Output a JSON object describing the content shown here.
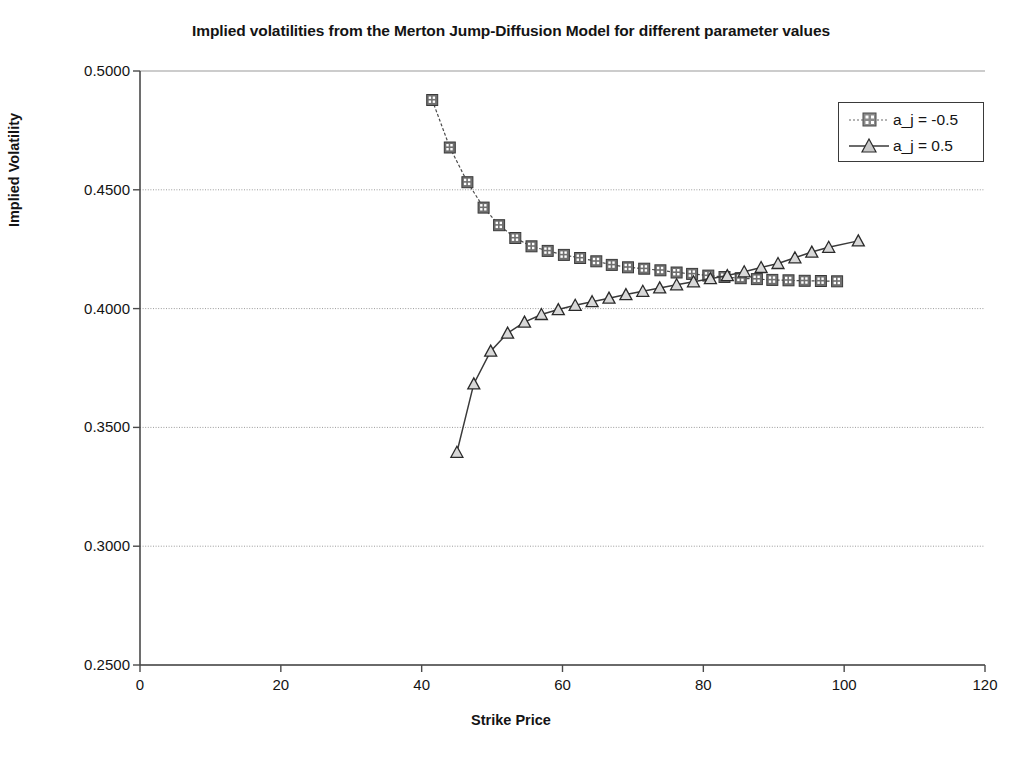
{
  "chart_data": {
    "type": "line",
    "title": "Implied volatilities from the Merton Jump-Diffusion Model for different parameter values",
    "xlabel": "Strike Price",
    "ylabel": "Implied Volatility",
    "xlim": [
      0,
      120
    ],
    "ylim": [
      0.25,
      0.5
    ],
    "xticks": [
      0,
      20,
      40,
      60,
      80,
      100,
      120
    ],
    "xtick_labels": [
      "0",
      "20",
      "40",
      "60",
      "80",
      "100",
      "120"
    ],
    "yticks": [
      0.25,
      0.3,
      0.35,
      0.4,
      0.45,
      0.5
    ],
    "ytick_labels": [
      "0.2500",
      "0.3000",
      "0.3500",
      "0.4000",
      "0.4500",
      "0.5000"
    ],
    "grid": "horizontal",
    "legend_position": "top-right",
    "series": [
      {
        "name": "a_j = -0.5",
        "marker": "square",
        "color": "#4a4a4a",
        "x": [
          41.5,
          44,
          46.5,
          48.8,
          51,
          53.3,
          55.6,
          57.9,
          60.2,
          62.5,
          64.8,
          67,
          69.3,
          71.6,
          73.9,
          76.2,
          78.4,
          80.7,
          83,
          85.3,
          87.6,
          89.8,
          92.1,
          94.4,
          96.7,
          99
        ],
        "y": [
          0.4878,
          0.4678,
          0.4532,
          0.4425,
          0.4351,
          0.4297,
          0.4262,
          0.4243,
          0.4226,
          0.4213,
          0.4199,
          0.4184,
          0.4174,
          0.4168,
          0.4161,
          0.4152,
          0.4146,
          0.4139,
          0.4133,
          0.4128,
          0.4124,
          0.4121,
          0.4119,
          0.4117,
          0.4116,
          0.4115
        ]
      },
      {
        "name": "a_j = 0.5",
        "marker": "triangle",
        "color": "#3a3a3a",
        "x": [
          45,
          47.4,
          49.8,
          52.2,
          54.6,
          57,
          59.4,
          61.8,
          64.2,
          66.6,
          69,
          71.4,
          73.8,
          76.2,
          78.6,
          81,
          83.4,
          85.8,
          88.2,
          90.6,
          93,
          95.4,
          97.8,
          102
        ],
        "y": [
          0.3395,
          0.3683,
          0.3821,
          0.3897,
          0.3943,
          0.3975,
          0.3996,
          0.4014,
          0.4029,
          0.4044,
          0.4059,
          0.4073,
          0.4087,
          0.41,
          0.4113,
          0.4126,
          0.4139,
          0.4155,
          0.4173,
          0.419,
          0.4214,
          0.4238,
          0.4258,
          0.4285
        ]
      }
    ]
  },
  "legend": {
    "items": [
      {
        "label": "a_j = -0.5"
      },
      {
        "label": "a_j = 0.5"
      }
    ]
  }
}
